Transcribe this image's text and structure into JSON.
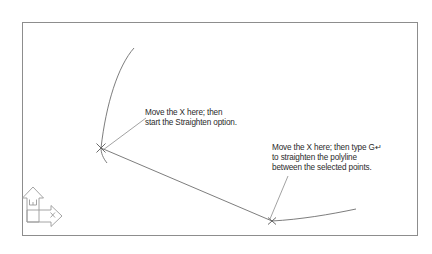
{
  "drawing": {
    "title": "CAD viewport - polyline straighten instruction",
    "background_color": "#ffffff",
    "frame": {
      "name": "viewport-border",
      "color": "#8d8d8d",
      "x": 22,
      "y": 22,
      "width": 396,
      "height": 214
    },
    "geometry": {
      "stroke_color": "#6e6e6e",
      "stroke_width": 0.9,
      "polyline_curve_path": "M134,48 C118,66 106,104 101,148",
      "polyline_lower_curve_path": "M101,148 C101,152 103,157 106,162",
      "segment_left_to_right_vertex": "M101,148 L272,221",
      "right_tail_path": "M272,221 C300,219 330,214 356,209"
    },
    "vertex_markers": [
      {
        "name": "x-marker-left",
        "x": 101,
        "y": 148,
        "size": 6.5,
        "color": "#5a5a5a"
      },
      {
        "name": "x-marker-right",
        "x": 272,
        "y": 221,
        "size": 5.5,
        "color": "#5a5a5a"
      }
    ],
    "leaders": [
      {
        "name": "leader-line-1",
        "from_x": 103,
        "from_y": 150,
        "to_x": 146,
        "to_y": 118,
        "color": "#8a8a8a"
      },
      {
        "name": "leader-line-2",
        "from_x": 270,
        "from_y": 219,
        "to_x": 288,
        "to_y": 176,
        "color": "#8a8a8a"
      }
    ]
  },
  "annotations": {
    "first": {
      "line1": "Move the X here; then",
      "line2": "start the Straighten option."
    },
    "second": {
      "line1": "Move the X here; then type G↵",
      "line2": "to straighten the polyline",
      "line3": "between the selected points."
    }
  },
  "ucs_icon": {
    "name": "ucs-world-coordinate-icon",
    "color": "#9a9a9a",
    "x_axis_label": "X",
    "y_axis_label": "Y",
    "world_marker_label": "W"
  }
}
